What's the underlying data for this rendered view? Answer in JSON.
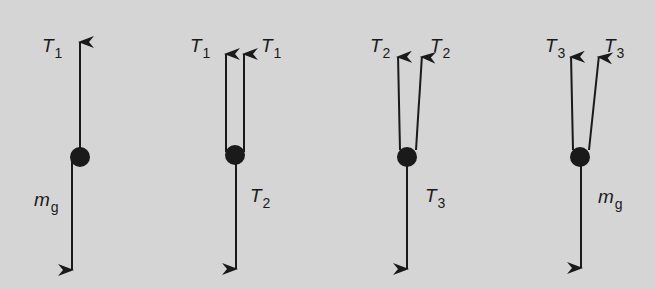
{
  "background_color": "#d5d5d5",
  "ink_color": "#1a1a1a",
  "diagrams": [
    {
      "name": "free-body-1",
      "dot": {
        "cx": 80,
        "cy": 157,
        "r": 10
      },
      "up_arrows": [
        {
          "x1": 80,
          "y1": 150,
          "x2": 80,
          "y2": 40,
          "label": {
            "main": "T",
            "sub": "1",
            "x": 42,
            "y": 36
          }
        }
      ],
      "down_arrow": {
        "x1": 72,
        "y1": 160,
        "x2": 72,
        "y2": 272,
        "label": {
          "main": "m",
          "sub": "g",
          "x": 34,
          "y": 190
        }
      }
    },
    {
      "name": "free-body-2",
      "dot": {
        "cx": 235,
        "cy": 155,
        "r": 10
      },
      "up_arrows": [
        {
          "x1": 226,
          "y1": 152,
          "x2": 226,
          "y2": 52,
          "label": {
            "main": "T",
            "sub": "1",
            "x": 190,
            "y": 36
          }
        },
        {
          "x1": 244,
          "y1": 152,
          "x2": 244,
          "y2": 52,
          "label": {
            "main": "T",
            "sub": "1",
            "x": 261,
            "y": 36
          }
        }
      ],
      "down_arrow": {
        "x1": 236,
        "y1": 160,
        "x2": 236,
        "y2": 271,
        "label": {
          "main": "T",
          "sub": "2",
          "x": 250,
          "y": 186
        }
      }
    },
    {
      "name": "free-body-3",
      "dot": {
        "cx": 407,
        "cy": 157,
        "r": 10
      },
      "up_arrows": [
        {
          "x1": 400,
          "y1": 150,
          "x2": 398,
          "y2": 55,
          "label": {
            "main": "T",
            "sub": "2",
            "x": 370,
            "y": 36
          }
        },
        {
          "x1": 416,
          "y1": 150,
          "x2": 422,
          "y2": 55,
          "label": {
            "main": "T",
            "sub": "2",
            "x": 430,
            "y": 36
          }
        }
      ],
      "down_arrow": {
        "x1": 407,
        "y1": 162,
        "x2": 407,
        "y2": 271,
        "label": {
          "main": "T",
          "sub": "3",
          "x": 425,
          "y": 186
        }
      }
    },
    {
      "name": "free-body-4",
      "dot": {
        "cx": 580,
        "cy": 157,
        "r": 10
      },
      "up_arrows": [
        {
          "x1": 573,
          "y1": 150,
          "x2": 571,
          "y2": 55,
          "label": {
            "main": "T",
            "sub": "3",
            "x": 545,
            "y": 36
          }
        },
        {
          "x1": 589,
          "y1": 150,
          "x2": 599,
          "y2": 55,
          "label": {
            "main": "T",
            "sub": "3",
            "x": 604,
            "y": 36
          }
        }
      ],
      "down_arrow": {
        "x1": 581,
        "y1": 162,
        "x2": 581,
        "y2": 270,
        "label": {
          "main": "m",
          "sub": "g",
          "x": 598,
          "y": 187
        }
      }
    }
  ]
}
